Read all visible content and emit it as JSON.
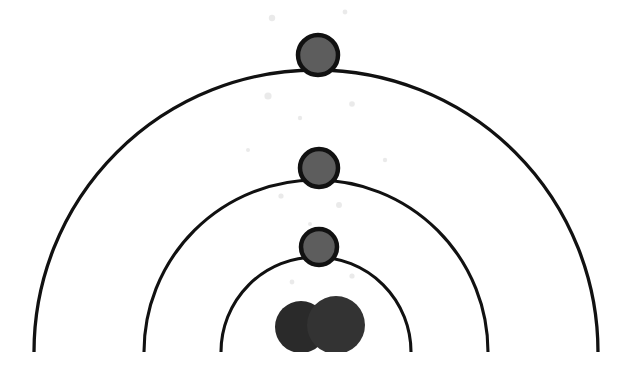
{
  "diagram": {
    "title": "Bohr atomic shell diagram",
    "subject": "atom",
    "canvas": {
      "width": 634,
      "height": 378,
      "background": "#ffffff"
    },
    "center": {
      "x": 316,
      "y": 352
    },
    "baseline_y": 352,
    "colors": {
      "stroke": "#111111",
      "electron_fill": "#5d5d5d",
      "nucleus_fill_front": "#333333",
      "nucleus_fill_back": "#2a2a2a",
      "background": "#ffffff"
    },
    "shells": [
      {
        "name": "inner-shell",
        "index": 1,
        "label": "K shell",
        "radius": 95,
        "apex_y": 257,
        "left_x": 221,
        "right_x": 411,
        "stroke_width": 3.1,
        "electron_count": 1
      },
      {
        "name": "middle-shell",
        "index": 2,
        "label": "L shell",
        "radius": 172,
        "apex_y": 180,
        "left_x": 144,
        "right_x": 488,
        "stroke_width": 3.1,
        "electron_count": 1
      },
      {
        "name": "outer-shell",
        "index": 3,
        "label": "M shell",
        "radius": 282,
        "apex_y": 70,
        "left_x": 34,
        "right_x": 598,
        "stroke_width": 3.3,
        "electron_count": 1
      }
    ],
    "electrons": [
      {
        "name": "electron-inner",
        "shell": "inner-shell",
        "cx": 319,
        "cy": 247,
        "r": 18,
        "stroke_width": 4.5,
        "fill": "#5d5d5d"
      },
      {
        "name": "electron-middle",
        "shell": "middle-shell",
        "cx": 319,
        "cy": 168,
        "r": 19,
        "stroke_width": 4.5,
        "fill": "#5d5d5d"
      },
      {
        "name": "electron-outer",
        "shell": "outer-shell",
        "cx": 318,
        "cy": 55,
        "r": 20,
        "stroke_width": 4.5,
        "fill": "#5d5d5d"
      }
    ],
    "nucleus": {
      "name": "nucleus",
      "particle_count": 2,
      "particles": [
        {
          "name": "nucleus-particle-left",
          "cx": 301,
          "cy": 327,
          "r": 26,
          "fill": "#2a2a2a",
          "layer": "back"
        },
        {
          "name": "nucleus-particle-right",
          "cx": 336,
          "cy": 325,
          "r": 29,
          "fill": "#333333",
          "layer": "front"
        }
      ]
    },
    "specks": [
      {
        "cx": 272,
        "cy": 18,
        "r": 3.2
      },
      {
        "cx": 345,
        "cy": 12,
        "r": 2.4
      },
      {
        "cx": 268,
        "cy": 96,
        "r": 3.6
      },
      {
        "cx": 352,
        "cy": 104,
        "r": 2.8
      },
      {
        "cx": 300,
        "cy": 118,
        "r": 2.2
      },
      {
        "cx": 281,
        "cy": 196,
        "r": 2.6
      },
      {
        "cx": 339,
        "cy": 205,
        "r": 3.0
      },
      {
        "cx": 310,
        "cy": 224,
        "r": 2.0
      },
      {
        "cx": 292,
        "cy": 282,
        "r": 2.4
      },
      {
        "cx": 352,
        "cy": 276,
        "r": 2.6
      },
      {
        "cx": 385,
        "cy": 160,
        "r": 2.2
      },
      {
        "cx": 248,
        "cy": 150,
        "r": 2.0
      }
    ]
  }
}
